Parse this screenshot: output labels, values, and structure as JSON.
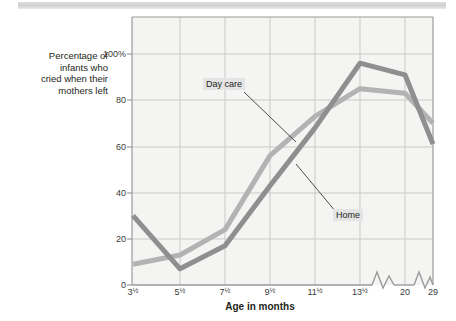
{
  "chart_data": {
    "type": "line",
    "title": "",
    "xlabel": "Age in months",
    "ylabel": "Percentage of infants who cried when their mothers left",
    "ylabel_lines": [
      "Percentage of",
      "infants who",
      "cried when their",
      "mothers left"
    ],
    "categories": [
      "3½",
      "5½",
      "7½",
      "9½",
      "11½",
      "13½",
      "20",
      "29"
    ],
    "x_tick_labels": [
      {
        "whole": "3",
        "frac": "½"
      },
      {
        "whole": "5",
        "frac": "½"
      },
      {
        "whole": "7",
        "frac": "½"
      },
      {
        "whole": "9",
        "frac": "½"
      },
      {
        "whole": "11",
        "frac": "½"
      },
      {
        "whole": "13",
        "frac": "½"
      },
      {
        "whole": "20",
        "frac": ""
      },
      {
        "whole": "29",
        "frac": ""
      }
    ],
    "y_tick_labels": [
      "100%",
      "80",
      "60",
      "40",
      "20",
      "0"
    ],
    "y_tick_values": [
      100,
      80,
      60,
      40,
      20,
      0
    ],
    "ylim": [
      0,
      115
    ],
    "grid": true,
    "legend_position": "inline-callouts",
    "axis_breaks": [
      "between 13½ and 20",
      "between 20 and 29"
    ],
    "series": [
      {
        "name": "Home",
        "color": "#8f8f8f",
        "values": [
          30,
          7,
          17,
          43,
          68,
          96,
          91,
          61
        ]
      },
      {
        "name": "Day care",
        "color": "#b3b3b3",
        "values": [
          9,
          13,
          24,
          56,
          73,
          85,
          83,
          70
        ]
      }
    ],
    "annotations": [
      {
        "text": "Day care",
        "series": "Day care"
      },
      {
        "text": "Home",
        "series": "Home"
      }
    ]
  },
  "colors": {
    "home_line": "#8f8f8f",
    "daycare_line": "#b3b3b3",
    "grid": "#c9c9c9",
    "axis": "#8a8a8a",
    "plot_background": "#f4f4f2",
    "text": "#231f20",
    "callout_background": "#e4e4e4"
  }
}
